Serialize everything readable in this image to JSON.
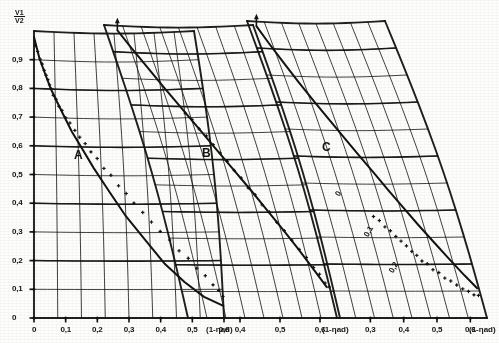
{
  "figure": {
    "title": "",
    "background": "#fdfdfb",
    "ink_color": "#15130f"
  },
  "axes": {
    "y_label_numerator": "V1",
    "y_label_denominator": "V2",
    "y_ticks": [
      "0",
      "0,1",
      "0,2",
      "0,3",
      "0,4",
      "0,5",
      "0,6",
      "0,7",
      "0,8",
      "0,9"
    ],
    "x_axis_name": "(1-ηad)"
  },
  "panels": [
    {
      "id": "A",
      "label": "A",
      "x_ticks": [
        "0",
        "0,1",
        "0,2",
        "0,3",
        "0,4",
        "0,5",
        "0,6"
      ],
      "x_axis_name": "(1-ηad)",
      "inner_labels": []
    },
    {
      "id": "B",
      "label": "B",
      "x_ticks": [
        "0,4",
        "0,5",
        "0,6"
      ],
      "x_axis_name": "(1-ηad)",
      "inner_labels": []
    },
    {
      "id": "C",
      "label": "C",
      "x_ticks": [
        "0,3",
        "0,4",
        "0,5",
        "0,6"
      ],
      "x_axis_name": "(1-ηad)",
      "inner_labels": [
        "0",
        "0,1",
        "0,2"
      ]
    }
  ],
  "chart_data": {
    "type": "scatter",
    "title": "",
    "xlabel": "(1-ηad)",
    "ylabel": "V1/V2",
    "grid": true,
    "legend": "none",
    "note": "Three sheared (non-orthogonal) nomogram panels A, B, C. Each panel shows a monotonically decreasing measured curve of V1/V2 against (1-ηad) with dense scattered measurement points following a solid fitted line. A vertical up-arrow marks the top of the fitted curve in panels B and C.",
    "ylim": [
      0,
      0.95
    ],
    "panels": [
      {
        "name": "A",
        "xlim": [
          0,
          0.6
        ],
        "xticks": [
          0,
          0.1,
          0.2,
          0.3,
          0.4,
          0.5,
          0.6
        ],
        "fit_line": {
          "x": [
            0.0,
            0.02,
            0.04,
            0.06,
            0.08,
            0.1,
            0.13,
            0.16,
            0.2,
            0.25,
            0.3,
            0.36,
            0.42,
            0.48,
            0.54,
            0.6
          ],
          "y": [
            0.93,
            0.86,
            0.81,
            0.76,
            0.72,
            0.68,
            0.62,
            0.57,
            0.5,
            0.42,
            0.34,
            0.26,
            0.18,
            0.12,
            0.07,
            0.04
          ]
        },
        "points": {
          "x": [
            0.005,
            0.012,
            0.02,
            0.027,
            0.034,
            0.041,
            0.048,
            0.055,
            0.063,
            0.07,
            0.08,
            0.09,
            0.1,
            0.112,
            0.125,
            0.14,
            0.155,
            0.172,
            0.19,
            0.21,
            0.232,
            0.255,
            0.28,
            0.305,
            0.33,
            0.358,
            0.385,
            0.412,
            0.44,
            0.468,
            0.495,
            0.52,
            0.545,
            0.568,
            0.585,
            0.598
          ],
          "y": [
            0.905,
            0.88,
            0.86,
            0.84,
            0.822,
            0.805,
            0.79,
            0.775,
            0.758,
            0.742,
            0.724,
            0.706,
            0.688,
            0.668,
            0.648,
            0.625,
            0.603,
            0.58,
            0.556,
            0.53,
            0.502,
            0.474,
            0.444,
            0.414,
            0.385,
            0.352,
            0.32,
            0.29,
            0.258,
            0.226,
            0.196,
            0.168,
            0.138,
            0.112,
            0.09,
            0.072
          ]
        },
        "arrow_top": false
      },
      {
        "name": "B",
        "xlim": [
          0.27,
          0.65
        ],
        "xticks": [
          0.4,
          0.5,
          0.6
        ],
        "fit_line": {
          "x": [
            0.3,
            0.32,
            0.345,
            0.37,
            0.398,
            0.425,
            0.452,
            0.48,
            0.508,
            0.535,
            0.562,
            0.588,
            0.612,
            0.635
          ],
          "y": [
            0.935,
            0.88,
            0.815,
            0.75,
            0.682,
            0.615,
            0.548,
            0.482,
            0.416,
            0.35,
            0.286,
            0.222,
            0.16,
            0.1
          ]
        },
        "points": {
          "x": [
            0.402,
            0.412,
            0.423,
            0.434,
            0.445,
            0.456,
            0.468,
            0.48,
            0.492,
            0.504,
            0.516,
            0.528,
            0.54,
            0.552,
            0.564,
            0.576,
            0.588,
            0.6,
            0.612,
            0.622,
            0.632,
            0.64
          ],
          "y": [
            0.672,
            0.646,
            0.62,
            0.594,
            0.568,
            0.54,
            0.512,
            0.484,
            0.456,
            0.428,
            0.4,
            0.372,
            0.344,
            0.314,
            0.284,
            0.254,
            0.224,
            0.196,
            0.166,
            0.14,
            0.116,
            0.098
          ]
        },
        "arrow_top": true
      },
      {
        "name": "C",
        "xlim": [
          0.2,
          0.65
        ],
        "xticks": [
          0.3,
          0.4,
          0.5,
          0.6
        ],
        "fit_line": {
          "x": [
            0.225,
            0.245,
            0.27,
            0.296,
            0.322,
            0.35,
            0.378,
            0.406,
            0.434,
            0.462,
            0.49,
            0.52,
            0.552,
            0.585,
            0.618,
            0.645
          ],
          "y": [
            0.935,
            0.882,
            0.82,
            0.758,
            0.7,
            0.64,
            0.582,
            0.524,
            0.468,
            0.412,
            0.358,
            0.302,
            0.246,
            0.19,
            0.136,
            0.095
          ]
        },
        "points": {
          "x": [
            0.392,
            0.404,
            0.416,
            0.428,
            0.44,
            0.452,
            0.465,
            0.478,
            0.49,
            0.503,
            0.516,
            0.53,
            0.544,
            0.558,
            0.572,
            0.586,
            0.6,
            0.614,
            0.628,
            0.64
          ],
          "y": [
            0.33,
            0.312,
            0.296,
            0.28,
            0.264,
            0.248,
            0.232,
            0.216,
            0.2,
            0.186,
            0.172,
            0.158,
            0.144,
            0.13,
            0.118,
            0.106,
            0.094,
            0.084,
            0.076,
            0.07
          ]
        },
        "arrow_top": true,
        "curve_labels": [
          {
            "text": "0",
            "x": 0.318,
            "y": 0.398
          },
          {
            "text": "0,1",
            "x": 0.366,
            "y": 0.278
          },
          {
            "text": "0,2",
            "x": 0.414,
            "y": 0.16
          }
        ]
      }
    ]
  }
}
